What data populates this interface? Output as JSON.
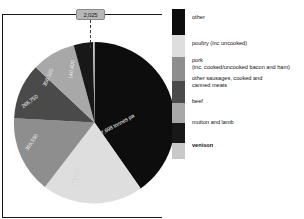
{
  "chart_data": {
    "type": "pie",
    "title": "",
    "unit": "tonnes pa",
    "categories": [
      "other",
      "poultry (inc uncooked)",
      "pork (inc. cooked/uncooked bacon and ham)",
      "other sausages, cooked and canned meats",
      "beef",
      "mutton and lamb",
      "venison"
    ],
    "values": [
      967698,
      483135,
      366550,
      266750,
      306520,
      140400,
      2025
    ],
    "value_labels": [
      "967,698 tonnes pa",
      "483,135",
      "366,550",
      "266,750",
      "306,520",
      "140,400",
      "2,025"
    ],
    "colors": [
      "#0d0d0d",
      "#dedede",
      "#8e8e8e",
      "#4a4a4a",
      "#a8a8a8",
      "#181818",
      "#c9c9c9"
    ],
    "legend_position": "right",
    "grid": false
  },
  "callout": {
    "value": "2,025",
    "series": "venison"
  },
  "slice_labels": {
    "other": "967,698 tonnes pa",
    "poultry": "483,135",
    "pork": "366,550",
    "sausages": "266,750",
    "beef": "306,520",
    "mutton": "140,400"
  },
  "legend": {
    "items": [
      {
        "label": "other",
        "line2": "",
        "color": "#0d0d0d",
        "bold": false
      },
      {
        "label": "poultry (inc  uncooked)",
        "line2": "",
        "color": "#dedede",
        "bold": false
      },
      {
        "label": "pork",
        "line2": "(inc. cooked/uncooked bacon and ham)",
        "color": "#8e8e8e",
        "bold": false
      },
      {
        "label": "other sausages, cooked and",
        "line2": "canned meats",
        "color": "#4a4a4a",
        "bold": false
      },
      {
        "label": "beef",
        "line2": "",
        "color": "#a8a8a8",
        "bold": false
      },
      {
        "label": "mutton and lamb",
        "line2": "",
        "color": "#181818",
        "bold": false
      },
      {
        "label": "venison",
        "line2": "",
        "color": "#c9c9c9",
        "bold": true
      }
    ]
  }
}
